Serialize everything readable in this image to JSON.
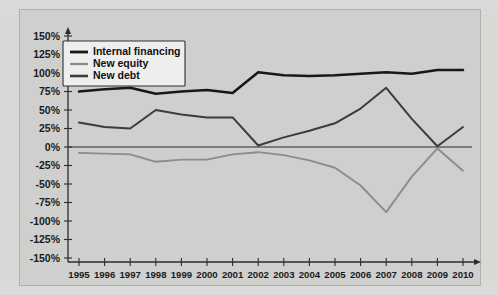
{
  "chart_data": {
    "type": "line",
    "title": "",
    "xlabel": "",
    "ylabel": "",
    "grid": false,
    "legend_position": "top-left",
    "x": [
      1995,
      1996,
      1997,
      1998,
      1999,
      2000,
      2001,
      2002,
      2003,
      2004,
      2005,
      2006,
      2007,
      2008,
      2009,
      2010
    ],
    "categories": [
      "1995",
      "1996",
      "1997",
      "1998",
      "1999",
      "2000",
      "2001",
      "2002",
      "2003",
      "2004",
      "2005",
      "2006",
      "2007",
      "2008",
      "2009",
      "2010"
    ],
    "ylim": [
      -150,
      150
    ],
    "yticks": [
      150,
      125,
      100,
      75,
      50,
      25,
      0,
      -25,
      -50,
      -75,
      -100,
      -125,
      -150
    ],
    "ytick_labels": [
      "150%",
      "125%",
      "100%",
      "75%",
      "50%",
      "25%",
      "0%",
      "-25%",
      "-50%",
      "-75%",
      "-100%",
      "-125%",
      "-150%"
    ],
    "series": [
      {
        "name": "Internal financing",
        "color": "#16181a",
        "values": [
          75,
          78,
          80,
          72,
          75,
          77,
          73,
          101,
          97,
          96,
          97,
          99,
          101,
          99,
          104,
          104
        ]
      },
      {
        "name": "New equity",
        "color": "#8a8c8e",
        "values": [
          -8,
          -9,
          -10,
          -20,
          -17,
          -17,
          -10,
          -7,
          -11,
          -18,
          -28,
          -52,
          -88,
          -40,
          -2,
          -32
        ]
      },
      {
        "name": "New debt",
        "color": "#3a3c3e",
        "values": [
          33,
          27,
          25,
          50,
          44,
          40,
          40,
          2,
          13,
          22,
          32,
          52,
          80,
          38,
          1,
          27
        ]
      }
    ],
    "legend_entries": [
      {
        "label": "Internal financing",
        "color": "#16181a"
      },
      {
        "label": "New equity",
        "color": "#8a8c8e"
      },
      {
        "label": "New debt",
        "color": "#3a3c3e"
      }
    ]
  }
}
